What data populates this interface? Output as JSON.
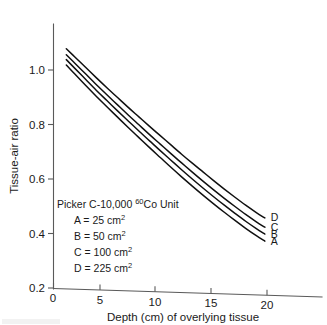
{
  "chart_data": {
    "type": "line",
    "title": "",
    "xlabel": "Depth (cm) of overlying tissue",
    "ylabel": "Tissue-air ratio",
    "xlim": [
      0,
      23.5
    ],
    "ylim": [
      0.2,
      1.12
    ],
    "xticks": [
      0,
      5,
      10,
      15,
      20
    ],
    "xticklabels": [
      "0",
      "5",
      "10",
      "15",
      "20"
    ],
    "yticks": [
      0.2,
      0.4,
      0.6,
      0.8,
      1.0
    ],
    "yticklabels": [
      "0.2",
      "0.4",
      "0.6",
      "0.8",
      "1.0"
    ],
    "grid": false,
    "legend_position": "inside-lower-left",
    "annotation_title": "Picker C-10,000 60Co Unit",
    "annotation_title_parts": {
      "prefix": "Picker C-10,000 ",
      "superscript": "60",
      "suffix": "Co Unit"
    },
    "annotations": [
      "A = 25 cm2",
      "B = 50 cm2",
      "C = 100 cm2",
      "D = 225 cm2"
    ],
    "series": [
      {
        "name": "A",
        "label": "A",
        "field_size": "25 cm2",
        "end_label": "A",
        "x": [
          1.2,
          2,
          3,
          4,
          5,
          6,
          7,
          8,
          9,
          10,
          11,
          12,
          13,
          14,
          15,
          16,
          17,
          18,
          19,
          19.8
        ],
        "values": [
          1.018,
          0.985,
          0.944,
          0.904,
          0.865,
          0.827,
          0.789,
          0.752,
          0.715,
          0.679,
          0.643,
          0.608,
          0.574,
          0.541,
          0.509,
          0.478,
          0.448,
          0.419,
          0.392,
          0.372
        ]
      },
      {
        "name": "B",
        "label": "B",
        "field_size": "50 cm2",
        "end_label": "B",
        "x": [
          1.2,
          2,
          3,
          4,
          5,
          6,
          7,
          8,
          9,
          10,
          11,
          12,
          13,
          14,
          15,
          16,
          17,
          18,
          19,
          19.8
        ],
        "values": [
          1.038,
          1.006,
          0.966,
          0.926,
          0.888,
          0.85,
          0.813,
          0.776,
          0.74,
          0.704,
          0.669,
          0.634,
          0.6,
          0.567,
          0.535,
          0.504,
          0.474,
          0.445,
          0.418,
          0.398
        ]
      },
      {
        "name": "C",
        "label": "C",
        "field_size": "100 cm2",
        "end_label": "C",
        "x": [
          1.2,
          2,
          3,
          4,
          5,
          6,
          7,
          8,
          9,
          10,
          11,
          12,
          13,
          14,
          15,
          16,
          17,
          18,
          19,
          19.8
        ],
        "values": [
          1.056,
          1.025,
          0.986,
          0.947,
          0.909,
          0.872,
          0.835,
          0.799,
          0.763,
          0.728,
          0.693,
          0.659,
          0.625,
          0.592,
          0.56,
          0.529,
          0.499,
          0.47,
          0.443,
          0.423
        ]
      },
      {
        "name": "D",
        "label": "D",
        "field_size": "225 cm2",
        "end_label": "D",
        "x": [
          1.2,
          2,
          3,
          4,
          5,
          6,
          7,
          8,
          9,
          10,
          11,
          12,
          13,
          14,
          15,
          16,
          17,
          18,
          19,
          19.8
        ],
        "values": [
          1.078,
          1.048,
          1.01,
          0.972,
          0.935,
          0.899,
          0.863,
          0.828,
          0.793,
          0.759,
          0.725,
          0.691,
          0.658,
          0.626,
          0.594,
          0.563,
          0.533,
          0.504,
          0.477,
          0.457
        ]
      }
    ],
    "colors": {
      "curve": "#101010",
      "axis": "#5a5a5a",
      "text": "#1a1a1a",
      "background": "#ffffff"
    }
  }
}
